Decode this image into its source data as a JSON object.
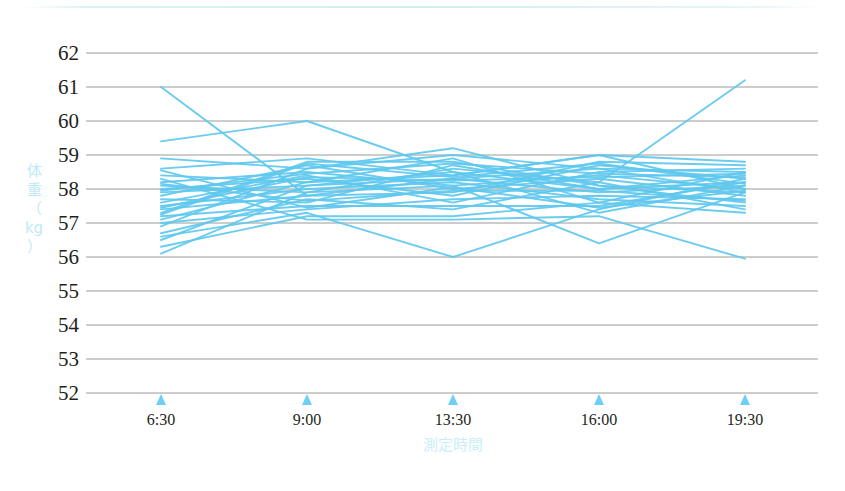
{
  "chart_data": {
    "type": "line",
    "title": "",
    "subtitle": "",
    "xlabel": "測定時間",
    "ylabel": "体重（kg）",
    "ylabel_chars": [
      "体",
      "重",
      "（",
      "kg",
      "）"
    ],
    "categories": [
      "6:30",
      "9:00",
      "13:30",
      "16:00",
      "19:30"
    ],
    "x_tick_labels": [
      "6:30",
      "9:00",
      "13:30",
      "16:00",
      "19:30"
    ],
    "y_tick_labels": [
      "62",
      "61",
      "60",
      "59",
      "58",
      "57",
      "56",
      "55",
      "54",
      "53",
      "52"
    ],
    "ylim": [
      52,
      62
    ],
    "y_step": 1,
    "grid": "horizontal",
    "legend": "none",
    "line_color": "#5ec8ee",
    "grid_color": "#9a9a9a",
    "tick_marker_color": "#6ecff6",
    "tick_marker_shape": "triangle-up",
    "series": [
      {
        "name": "s01",
        "values": [
          61.0,
          57.8,
          58.3,
          58.6,
          57.9
        ]
      },
      {
        "name": "s02",
        "values": [
          59.4,
          60.0,
          58.5,
          58.0,
          58.2
        ]
      },
      {
        "name": "s03",
        "values": [
          58.9,
          58.6,
          59.2,
          58.1,
          57.6
        ]
      },
      {
        "name": "s04",
        "values": [
          58.6,
          58.9,
          58.4,
          59.0,
          58.8
        ]
      },
      {
        "name": "s05",
        "values": [
          58.4,
          58.2,
          58.9,
          57.6,
          58.5
        ]
      },
      {
        "name": "s06",
        "values": [
          58.2,
          58.5,
          58.1,
          58.4,
          58.0
        ]
      },
      {
        "name": "s07",
        "values": [
          58.1,
          57.9,
          58.6,
          58.2,
          61.2
        ]
      },
      {
        "name": "s08",
        "values": [
          58.0,
          58.3,
          57.8,
          58.7,
          58.3
        ]
      },
      {
        "name": "s09",
        "values": [
          57.9,
          58.1,
          58.3,
          57.9,
          58.1
        ]
      },
      {
        "name": "s10",
        "values": [
          57.8,
          58.7,
          58.0,
          58.3,
          57.8
        ]
      },
      {
        "name": "s11",
        "values": [
          57.7,
          57.6,
          58.7,
          58.0,
          58.4
        ]
      },
      {
        "name": "s12",
        "values": [
          57.6,
          58.4,
          57.6,
          58.5,
          58.6
        ]
      },
      {
        "name": "s13",
        "values": [
          57.5,
          58.0,
          58.2,
          57.7,
          57.5
        ]
      },
      {
        "name": "s14",
        "values": [
          57.4,
          57.8,
          57.9,
          58.8,
          58.7
        ]
      },
      {
        "name": "s15",
        "values": [
          57.3,
          58.8,
          58.8,
          58.1,
          57.9
        ]
      },
      {
        "name": "s16",
        "values": [
          57.2,
          57.5,
          57.5,
          57.5,
          58.2
        ]
      },
      {
        "name": "s17",
        "values": [
          57.1,
          58.2,
          58.4,
          59.0,
          58.0
        ]
      },
      {
        "name": "s18",
        "values": [
          57.0,
          57.4,
          57.7,
          57.8,
          57.7
        ]
      },
      {
        "name": "s19",
        "values": [
          56.9,
          58.6,
          59.0,
          58.6,
          58.5
        ]
      },
      {
        "name": "s20",
        "values": [
          56.7,
          57.7,
          57.4,
          58.2,
          57.4
        ]
      },
      {
        "name": "s21",
        "values": [
          56.5,
          58.1,
          58.5,
          57.3,
          58.1
        ]
      },
      {
        "name": "s22",
        "values": [
          56.3,
          57.2,
          57.2,
          57.6,
          57.3
        ]
      },
      {
        "name": "s23",
        "values": [
          56.1,
          57.9,
          58.1,
          56.4,
          57.9
        ]
      },
      {
        "name": "s24",
        "values": [
          56.6,
          57.3,
          56.0,
          57.4,
          58.3
        ]
      },
      {
        "name": "s25",
        "values": [
          58.3,
          57.1,
          57.1,
          57.2,
          55.95
        ]
      },
      {
        "name": "s26",
        "values": [
          57.95,
          58.45,
          58.75,
          58.45,
          58.35
        ]
      },
      {
        "name": "s27",
        "values": [
          58.15,
          57.65,
          57.95,
          57.95,
          57.65
        ]
      },
      {
        "name": "s28",
        "values": [
          57.45,
          58.35,
          58.25,
          58.35,
          58.45
        ]
      },
      {
        "name": "s29",
        "values": [
          58.55,
          57.45,
          58.05,
          57.45,
          57.95
        ]
      },
      {
        "name": "s30",
        "values": [
          57.25,
          58.75,
          58.35,
          58.75,
          58.15
        ]
      }
    ],
    "axis_geometry": {
      "plot_left": 161,
      "plot_right": 745,
      "grid_right": 818,
      "y_top_px": 53,
      "y_bottom_px": 393
    }
  }
}
